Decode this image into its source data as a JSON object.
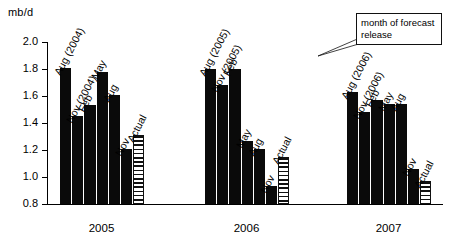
{
  "chart": {
    "y_axis_title": "mb/d",
    "annotation": "month of forecast release"
  },
  "chart_data": {
    "type": "bar",
    "title": "",
    "subtitle": "",
    "xlabel": "",
    "ylabel": "mb/d",
    "ylim": [
      0.8,
      2.0
    ],
    "ytick_labels": [
      "2.0",
      "1.8",
      "1.6",
      "1.4",
      "1.2",
      "1.0",
      "0.8"
    ],
    "yticks": [
      2.0,
      1.8,
      1.6,
      1.4,
      1.2,
      1.0,
      0.8
    ],
    "grid": false,
    "legend": false,
    "annotations": [
      "month of forecast release"
    ],
    "categories": [
      "2005",
      "2006",
      "2007"
    ],
    "groups": [
      {
        "category": "2005",
        "bars": [
          {
            "label": "Aug (2004)",
            "value": 1.81,
            "style": "solid"
          },
          {
            "label": "Nov (2004)",
            "value": 1.45,
            "style": "solid"
          },
          {
            "label": "Feb",
            "value": 1.53,
            "style": "solid"
          },
          {
            "label": "May",
            "value": 1.78,
            "style": "solid"
          },
          {
            "label": "Aug",
            "value": 1.61,
            "style": "solid"
          },
          {
            "label": "Nov",
            "value": 1.21,
            "style": "solid"
          },
          {
            "label": "Actual",
            "value": 1.31,
            "style": "hatched"
          }
        ]
      },
      {
        "category": "2006",
        "bars": [
          {
            "label": "Aug (2005)",
            "value": 1.8,
            "style": "solid"
          },
          {
            "label": "Nov (2005)",
            "value": 1.68,
            "style": "solid"
          },
          {
            "label": "Feb",
            "value": 1.8,
            "style": "solid"
          },
          {
            "label": "May",
            "value": 1.27,
            "style": "solid"
          },
          {
            "label": "Aug",
            "value": 1.21,
            "style": "solid"
          },
          {
            "label": "Nov",
            "value": 0.93,
            "style": "solid"
          },
          {
            "label": "Actual",
            "value": 1.15,
            "style": "hatched"
          }
        ]
      },
      {
        "category": "2007",
        "bars": [
          {
            "label": "Aug (2006)",
            "value": 1.63,
            "style": "solid"
          },
          {
            "label": "Nov (2006)",
            "value": 1.48,
            "style": "solid"
          },
          {
            "label": "Feb",
            "value": 1.57,
            "style": "solid"
          },
          {
            "label": "May",
            "value": 1.54,
            "style": "solid"
          },
          {
            "label": "Aug",
            "value": 1.54,
            "style": "solid"
          },
          {
            "label": "Nov",
            "value": 1.06,
            "style": "solid"
          },
          {
            "label": "Actual",
            "value": 0.97,
            "style": "hatched"
          }
        ]
      }
    ]
  }
}
